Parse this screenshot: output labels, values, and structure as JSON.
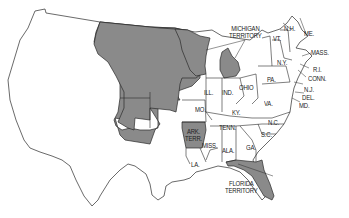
{
  "map": {
    "title": "United States, c. 1836",
    "colors": {
      "territory": "#8a8a8a",
      "state": "#ffffff",
      "border": "#2a2a2a",
      "background": "#ffffff"
    },
    "labels": {
      "michigan_territory": [
        "MICHIGAN",
        "TERRITORY"
      ],
      "florida_territory": [
        "FLORIDA",
        "TERRITORY"
      ],
      "ark_terr": [
        "ARK.",
        "TERR."
      ],
      "vt": "VT.",
      "nh": "N.H.",
      "me": "ME.",
      "mass": "MASS.",
      "ny": "N.Y.",
      "ri": "R.I.",
      "conn": "CONN.",
      "nj": "N.J.",
      "del": "DEL.",
      "md": "MD.",
      "pa": "PA.",
      "ohio": "OHIO",
      "ind": "IND.",
      "ill": "ILL.",
      "mo": "MO.",
      "ky": "KY.",
      "va": "VA.",
      "tenn": "TENN.",
      "nc": "N.C.",
      "sc": "S.C.",
      "ga": "GA.",
      "ala": "ALA.",
      "miss": "MISS.",
      "la": "LA."
    }
  }
}
